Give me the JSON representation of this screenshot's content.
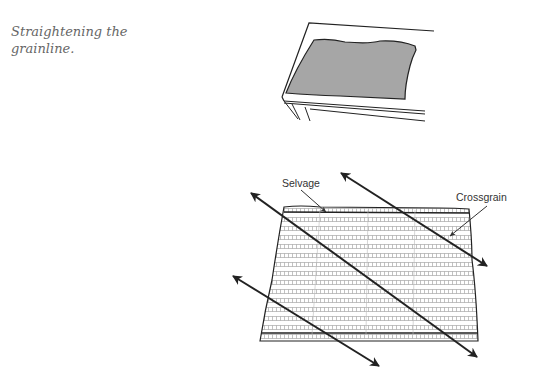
{
  "caption": "Straightening the grainline.",
  "figure": {
    "top_illustration": "fabric laid flat on table",
    "labels": {
      "selvage": "Selvage",
      "crossgrain": "Crossgrain"
    },
    "colors": {
      "fabric_fill": "#a6a6a6",
      "line": "#222222",
      "weave": "#8a8a8a"
    }
  }
}
